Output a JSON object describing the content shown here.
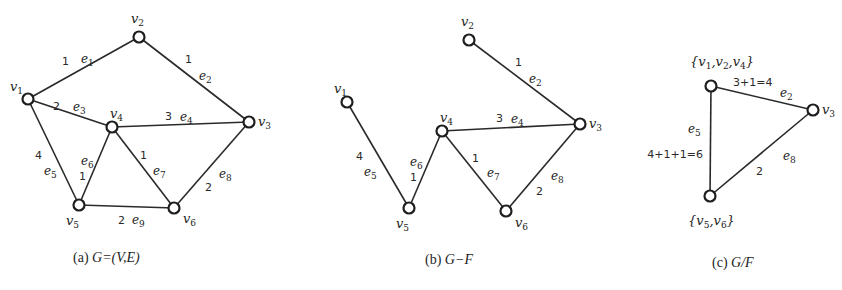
{
  "colors": {
    "stroke": "#2a2a2a",
    "node_fill": "#ffffff",
    "text": "#1e1e1e"
  },
  "graphs": [
    {
      "id": "a",
      "caption_prefix": "(a) ",
      "caption_math": "G=(V,E)",
      "caption_pos": [
        73,
        262
      ],
      "nodes": [
        {
          "id": "v1",
          "base": "v",
          "sub": "1",
          "x": 28,
          "y": 99,
          "lx": 10,
          "ly": 91
        },
        {
          "id": "v2",
          "base": "v",
          "sub": "2",
          "x": 139,
          "y": 37,
          "lx": 131,
          "ly": 23
        },
        {
          "id": "v3",
          "base": "v",
          "sub": "3",
          "x": 249,
          "y": 122,
          "lx": 258,
          "ly": 126
        },
        {
          "id": "v4",
          "base": "v",
          "sub": "4",
          "x": 112,
          "y": 127,
          "lx": 110,
          "ly": 118
        },
        {
          "id": "v5",
          "base": "v",
          "sub": "5",
          "x": 79,
          "y": 205,
          "lx": 66,
          "ly": 225
        },
        {
          "id": "v6",
          "base": "v",
          "sub": "6",
          "x": 174,
          "y": 208,
          "lx": 183,
          "ly": 223
        }
      ],
      "edges": [
        {
          "from": "v1",
          "to": "v2",
          "name": "e",
          "sub": "1",
          "weight": "1",
          "nx": 81,
          "ny": 63,
          "wx": 62,
          "wy": 65
        },
        {
          "from": "v2",
          "to": "v3",
          "name": "e",
          "sub": "2",
          "weight": "1",
          "nx": 199,
          "ny": 80,
          "wx": 185,
          "wy": 63
        },
        {
          "from": "v1",
          "to": "v4",
          "name": "e",
          "sub": "3",
          "weight": "2",
          "nx": 73,
          "ny": 111,
          "wx": 53,
          "wy": 110
        },
        {
          "from": "v4",
          "to": "v3",
          "name": "e",
          "sub": "4",
          "weight": "3",
          "nx": 180,
          "ny": 121,
          "wx": 165,
          "wy": 120
        },
        {
          "from": "v1",
          "to": "v5",
          "name": "e",
          "sub": "5",
          "weight": "4",
          "nx": 44,
          "ny": 175,
          "wx": 35,
          "wy": 159
        },
        {
          "from": "v4",
          "to": "v5",
          "name": "e",
          "sub": "6",
          "weight": "1",
          "nx": 81,
          "ny": 165,
          "wx": 79,
          "wy": 180
        },
        {
          "from": "v4",
          "to": "v6",
          "name": "e",
          "sub": "7",
          "weight": "1",
          "nx": 153,
          "ny": 175,
          "wx": 140,
          "wy": 159
        },
        {
          "from": "v3",
          "to": "v6",
          "name": "e",
          "sub": "8",
          "weight": "2",
          "nx": 219,
          "ny": 178,
          "wx": 205,
          "wy": 191
        },
        {
          "from": "v5",
          "to": "v6",
          "name": "e",
          "sub": "9",
          "weight": "2",
          "nx": 132,
          "ny": 224,
          "wx": 118,
          "wy": 224
        }
      ]
    },
    {
      "id": "b",
      "caption_prefix": "(b) ",
      "caption_math": "G−F",
      "caption_pos": [
        425,
        264
      ],
      "nodes": [
        {
          "id": "v1",
          "base": "v",
          "sub": "1",
          "x": 347,
          "y": 102,
          "lx": 334,
          "ly": 93
        },
        {
          "id": "v2",
          "base": "v",
          "sub": "2",
          "x": 469,
          "y": 40,
          "lx": 461,
          "ly": 26
        },
        {
          "id": "v3",
          "base": "v",
          "sub": "3",
          "x": 580,
          "y": 124,
          "lx": 589,
          "ly": 128
        },
        {
          "id": "v4",
          "base": "v",
          "sub": "4",
          "x": 442,
          "y": 131,
          "lx": 440,
          "ly": 122
        },
        {
          "id": "v5",
          "base": "v",
          "sub": "5",
          "x": 409,
          "y": 208,
          "lx": 396,
          "ly": 228
        },
        {
          "id": "v6",
          "base": "v",
          "sub": "6",
          "x": 506,
          "y": 211,
          "lx": 515,
          "ly": 227
        }
      ],
      "edges": [
        {
          "from": "v2",
          "to": "v3",
          "name": "e",
          "sub": "2",
          "weight": "1",
          "nx": 529,
          "ny": 83,
          "wx": 515,
          "wy": 66
        },
        {
          "from": "v4",
          "to": "v3",
          "name": "e",
          "sub": "4",
          "weight": "3",
          "nx": 511,
          "ny": 123,
          "wx": 496,
          "wy": 122
        },
        {
          "from": "v1",
          "to": "v5",
          "name": "e",
          "sub": "5",
          "weight": "4",
          "nx": 364,
          "ny": 176,
          "wx": 356,
          "wy": 160
        },
        {
          "from": "v4",
          "to": "v5",
          "name": "e",
          "sub": "6",
          "weight": "1",
          "nx": 410,
          "ny": 166,
          "wx": 410,
          "wy": 181
        },
        {
          "from": "v4",
          "to": "v6",
          "name": "e",
          "sub": "7",
          "weight": "1",
          "nx": 487,
          "ny": 177,
          "wx": 472,
          "wy": 162
        },
        {
          "from": "v3",
          "to": "v6",
          "name": "e",
          "sub": "8",
          "weight": "2",
          "nx": 551,
          "ny": 180,
          "wx": 536,
          "wy": 195
        }
      ]
    },
    {
      "id": "c",
      "caption_prefix": "(c)  ",
      "caption_math": "G/F",
      "caption_pos": [
        712,
        267
      ],
      "nodes": [
        {
          "id": "v124",
          "set": true,
          "parts": [
            "1",
            "2",
            "4"
          ],
          "x": 711,
          "y": 86,
          "lx": 690,
          "ly": 66
        },
        {
          "id": "v3",
          "base": "v",
          "sub": "3",
          "x": 813,
          "y": 110,
          "lx": 822,
          "ly": 114
        },
        {
          "id": "v56",
          "set": true,
          "parts": [
            "5",
            "6"
          ],
          "x": 710,
          "y": 196,
          "lx": 688,
          "ly": 225
        }
      ],
      "edges": [
        {
          "from": "v124",
          "to": "v3",
          "name": "e",
          "sub": "2",
          "weight": "3+1=4",
          "nx": 780,
          "ny": 97,
          "wx": 733,
          "wy": 86,
          "wanchor": "start"
        },
        {
          "from": "v124",
          "to": "v56",
          "name": "e",
          "sub": "5",
          "weight": "4+1+1=6",
          "nx": 688,
          "ny": 133,
          "wx": 703,
          "wy": 158,
          "wanchor": "end"
        },
        {
          "from": "v3",
          "to": "v56",
          "name": "e",
          "sub": "8",
          "weight": "2",
          "nx": 783,
          "ny": 160,
          "wx": 756,
          "wy": 175,
          "wanchor": "start"
        }
      ]
    }
  ]
}
